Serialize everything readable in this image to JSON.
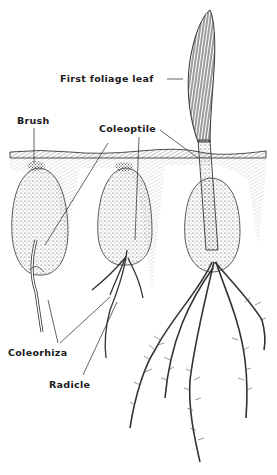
{
  "diagram": {
    "stages": [
      "seed with emerging coleorhiza",
      "seed with radicle and roots",
      "seedling with first foliage leaf"
    ],
    "labels": {
      "first_foliage_leaf": "First foliage leaf",
      "brush": "Brush",
      "coleoptile": "Coleoptile",
      "coleorhiza": "Coleorhiza",
      "radicle": "Radicle"
    },
    "colors": {
      "ink": "#1a1a1a",
      "soil_shade": "#b8b8b8",
      "background": "#ffffff"
    }
  }
}
